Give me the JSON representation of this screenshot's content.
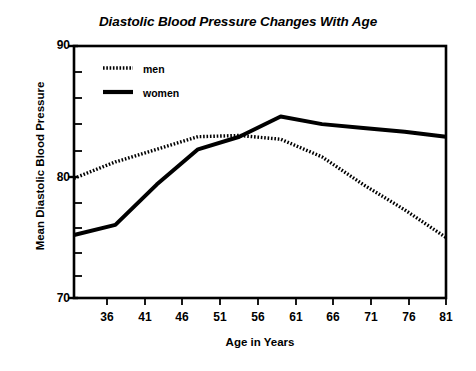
{
  "chart_data": {
    "type": "line",
    "title": "Diastolic Blood Pressure Changes With Age",
    "xlabel": "Age in Years",
    "ylabel": "Mean Diastolic Blood Pressure",
    "x": [
      36,
      41,
      46,
      51,
      56,
      61,
      66,
      71,
      76,
      81
    ],
    "xtick_labels": [
      "36",
      "41",
      "46",
      "51",
      "56",
      "61",
      "66",
      "71",
      "76",
      "81"
    ],
    "ytick_labels": [
      "90",
      "80",
      "70"
    ],
    "ytick_values": [
      90,
      80,
      70
    ],
    "yminor_values": [
      88,
      86,
      84,
      82,
      78,
      76,
      74,
      72
    ],
    "xlim": [
      36,
      81
    ],
    "ylim": [
      70,
      90
    ],
    "grid": false,
    "legend_position": "top-left",
    "series": [
      {
        "name": "men",
        "style": "dotted",
        "color": "#000000",
        "values": [
          79.5,
          80.8,
          81.8,
          82.8,
          82.9,
          82.6,
          81.2,
          79.0,
          77.0,
          74.8
        ]
      },
      {
        "name": "women",
        "style": "solid",
        "color": "#000000",
        "values": [
          75.0,
          75.8,
          79.0,
          81.8,
          82.8,
          84.4,
          83.8,
          83.5,
          83.2,
          82.8
        ]
      }
    ]
  },
  "legend": {
    "items": [
      {
        "label": "men"
      },
      {
        "label": "women"
      }
    ]
  },
  "colors": {
    "axis": "#000000",
    "background": "#ffffff",
    "series": "#000000"
  }
}
